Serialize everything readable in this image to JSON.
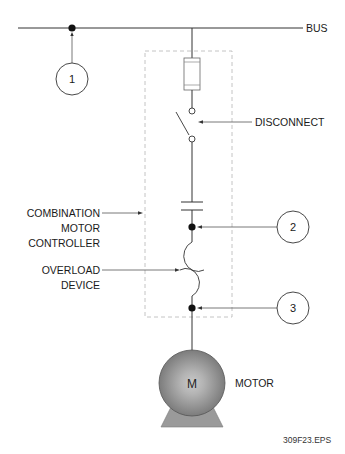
{
  "diagram": {
    "labels": {
      "bus": "BUS",
      "disconnect": "DISCONNECT",
      "combination_line1": "COMBINATION",
      "combination_line2": "MOTOR",
      "combination_line3": "CONTROLLER",
      "overload_line1": "OVERLOAD",
      "overload_line2": "DEVICE",
      "motor": "MOTOR",
      "motor_symbol": "M",
      "figure_id": "309F23.EPS"
    },
    "callouts": [
      {
        "number": "1",
        "target": "bus-junction"
      },
      {
        "number": "2",
        "target": "controller-output-junction"
      },
      {
        "number": "3",
        "target": "overload-output-junction"
      }
    ],
    "components": [
      {
        "name": "fuse",
        "icon": "fuse-icon"
      },
      {
        "name": "disconnect switch",
        "icon": "switch-icon"
      },
      {
        "name": "contactor",
        "icon": "contactor-icon"
      },
      {
        "name": "overload device",
        "icon": "overload-icon"
      },
      {
        "name": "motor",
        "icon": "motor-icon"
      }
    ],
    "colors": {
      "line": "#333333",
      "dashed_box": "#bdbdbd",
      "motor_fill_center": "#c8c8c8",
      "motor_fill_edge": "#7a7a7a",
      "motor_base": "#9a9a9a"
    }
  }
}
